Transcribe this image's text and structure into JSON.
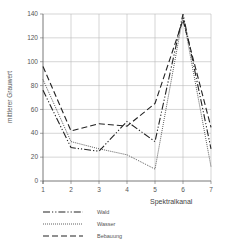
{
  "chart_data": {
    "type": "line",
    "title": "",
    "xlabel": "Spektralkanal",
    "ylabel": "mittlerer Grauwert",
    "x": [
      1,
      2,
      3,
      4,
      5,
      6,
      7
    ],
    "x_ticks": [
      "1",
      "2",
      "3",
      "4",
      "5",
      "6",
      "7"
    ],
    "y_ticks": [
      "0",
      "20",
      "40",
      "60",
      "80",
      "100",
      "120",
      "140"
    ],
    "ylim": [
      0,
      140
    ],
    "xlim": [
      1,
      7
    ],
    "grid": true,
    "legend_position": "bottom-left",
    "series": [
      {
        "name": "Wald",
        "style": "dash-dot",
        "values": [
          76,
          28,
          25,
          50,
          33,
          140,
          27
        ]
      },
      {
        "name": "Wasser",
        "style": "dotted",
        "values": [
          85,
          33,
          27,
          22,
          10,
          138,
          12
        ]
      },
      {
        "name": "Bebauung",
        "style": "dashed",
        "values": [
          96,
          42,
          48,
          46,
          65,
          135,
          45
        ]
      }
    ]
  }
}
